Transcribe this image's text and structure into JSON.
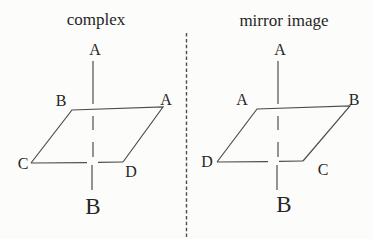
{
  "figure": {
    "left": {
      "title": "complex",
      "axis_top_label": "A",
      "axis_bottom_label": "B",
      "corners": {
        "top_left": "B",
        "top_right": "A",
        "bottom_left": "C",
        "bottom_right": "D"
      }
    },
    "right": {
      "title": "mirror image",
      "axis_top_label": "A",
      "axis_bottom_label": "B",
      "corners": {
        "top_left": "A",
        "top_right": "B",
        "bottom_left": "D",
        "bottom_right": "C"
      }
    },
    "colors": {
      "line": "#4d4d4d",
      "text": "#262626",
      "background": "#fcfcfa"
    }
  }
}
